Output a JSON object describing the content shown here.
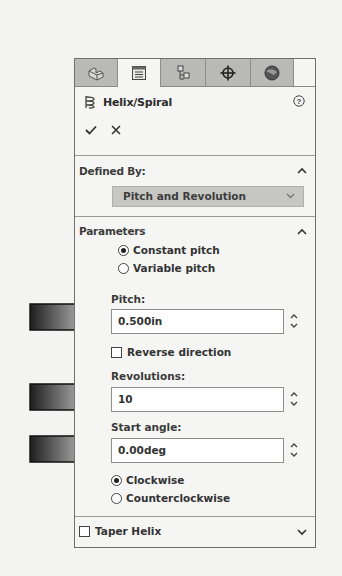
{
  "tabs": [
    {
      "name": "featuremanager-tab",
      "icon": "part-icon",
      "active": false
    },
    {
      "name": "propertymanager-tab",
      "icon": "property-list-icon",
      "active": true
    },
    {
      "name": "configurationmanager-tab",
      "icon": "configuration-icon",
      "active": false
    },
    {
      "name": "dimxpertmanager-tab",
      "icon": "crosshair-icon",
      "active": false
    },
    {
      "name": "displaymanager-tab",
      "icon": "appearance-sphere-icon",
      "active": false
    }
  ],
  "header": {
    "title": "Helix/Spiral",
    "icon": "helix-icon",
    "help_icon": "help-icon",
    "ok_icon": "checkmark-icon",
    "cancel_icon": "close-icon"
  },
  "defined_by": {
    "section_title": "Defined By:",
    "selected": "Pitch and Revolution"
  },
  "parameters": {
    "section_title": "Parameters",
    "pitch_mode_options": [
      {
        "label": "Constant pitch",
        "selected": true
      },
      {
        "label": "Variable pitch",
        "selected": false
      }
    ],
    "pitch": {
      "label": "Pitch:",
      "value": "0.500in"
    },
    "reverse_direction": {
      "label": "Reverse direction",
      "checked": false
    },
    "revolutions": {
      "label": "Revolutions:",
      "value": "10"
    },
    "start_angle": {
      "label": "Start angle:",
      "value": "0.00deg"
    },
    "direction_options": [
      {
        "label": "Clockwise",
        "selected": true
      },
      {
        "label": "Counterclockwise",
        "selected": false
      }
    ]
  },
  "taper_helix": {
    "label": "Taper Helix",
    "checked": false
  },
  "callout_arrows": [
    {
      "points_to": "pitch"
    },
    {
      "points_to": "revolutions"
    },
    {
      "points_to": "start_angle"
    }
  ],
  "colors": {
    "panel_bg": "#f5f5f3",
    "tab_inactive": "#b9b9b6",
    "dropdown_bg": "#c6c6c3",
    "border": "#6f6f6f"
  }
}
